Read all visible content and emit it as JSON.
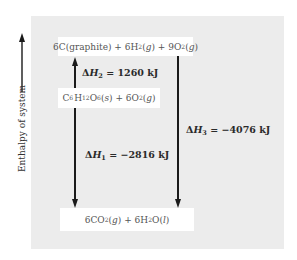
{
  "diagram": {
    "type": "enthalpy-level-diagram",
    "axis": {
      "label": "Enthalpy of system",
      "direction": "up"
    },
    "levels": {
      "top": {
        "prefix": "6C(graphite) + 6H",
        "sub1": "2",
        "mid1": "(",
        "g1": "g",
        "mid2": ") + 9O",
        "sub2": "2",
        "mid3": "(",
        "g2": "g",
        "end": ")",
        "plain": "6C(graphite) + 6H2(g) + 9O2(g)"
      },
      "middle": {
        "c": "C",
        "c_sub": "6",
        "h": "H",
        "h_sub": "12",
        "o": "O",
        "o_sub": "6",
        "state1_open": "(",
        "state1": "s",
        "rest": ") + 6O",
        "o2_sub": "2",
        "state2_open": "(",
        "state2": "g",
        "end": ")",
        "plain": "C6H12O6(s) + 6O2(g)"
      },
      "bottom": {
        "prefix": "6CO",
        "sub1": "2",
        "open1": "(",
        "g": "g",
        "mid": ") + 6H",
        "sub2": "2",
        "mid2": "O(",
        "l": "l",
        "end": ")",
        "plain": "6CO2(g) + 6H2O(l)"
      }
    },
    "transitions": [
      {
        "id": "dH2",
        "symbol": "ΔH",
        "subscript": "2",
        "value": "= 1260 kJ",
        "from": "middle",
        "to": "top",
        "direction": "up"
      },
      {
        "id": "dH1",
        "symbol": "ΔH",
        "subscript": "1",
        "value": "= −2816 kJ",
        "from": "middle",
        "to": "bottom",
        "direction": "down"
      },
      {
        "id": "dH3",
        "symbol": "ΔH",
        "subscript": "3",
        "value": "= −4076 kJ",
        "from": "top",
        "to": "bottom",
        "direction": "down"
      }
    ]
  }
}
